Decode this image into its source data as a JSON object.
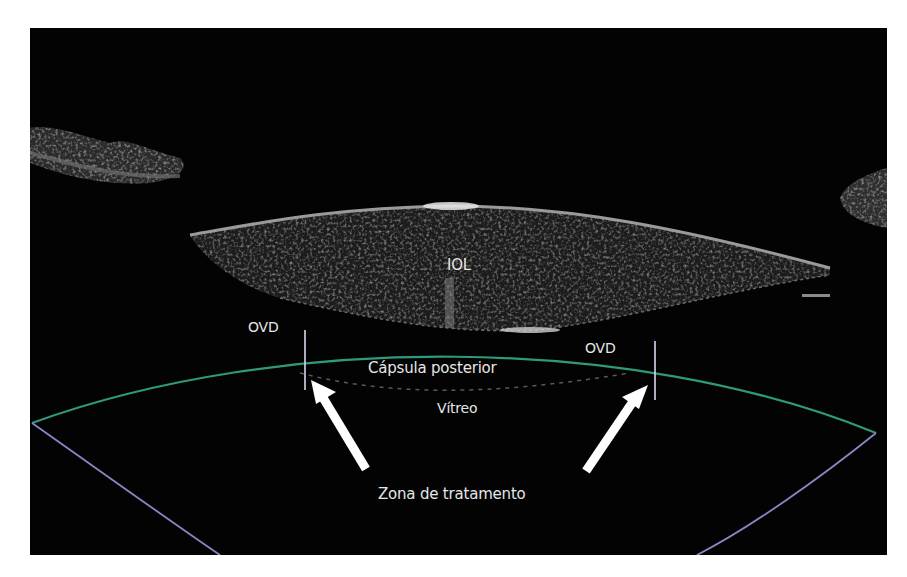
{
  "image": {
    "type": "OCT / ultrasound cross-section of the eye",
    "background_color": "#030303",
    "page_background": "#ffffff"
  },
  "labels": {
    "iol": "IOL",
    "ovd_left": "OVD",
    "ovd_right": "OVD",
    "capsula_posterior": "Cápsula posterior",
    "vitreo": "Vítreo",
    "zona_tratamento": "Zona de tratamento"
  },
  "overlays": {
    "treatment_upper_boundary_color": "#2e9a78",
    "treatment_lower_boundary_color": "#8a86c6",
    "ovd_marker_color": "#d8d8f0",
    "arrow_color": "#ffffff"
  }
}
